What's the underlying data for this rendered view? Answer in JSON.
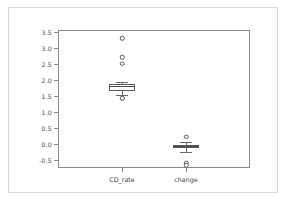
{
  "chart_data": {
    "type": "box",
    "title": "",
    "xlabel": "",
    "ylabel": "",
    "ylim": [
      -0.75,
      3.55
    ],
    "grid": false,
    "legend": null,
    "yticks": [
      3.5,
      3.0,
      2.5,
      2.0,
      1.5,
      1.0,
      0.5,
      0.0,
      -0.5
    ],
    "ytick_labels": [
      "3.5",
      "3.0",
      "2.5",
      "2.0",
      "1.5",
      "1.0",
      "0.5",
      "0.0",
      "-0.5"
    ],
    "categories": [
      "CD_rate",
      "change"
    ],
    "boxes": [
      {
        "label": "CD_rate",
        "q1": 1.66,
        "median": 1.79,
        "q3": 1.86,
        "whisker_low": 1.52,
        "whisker_high": 1.92,
        "fliers": [
          3.3,
          2.7,
          2.5,
          1.43
        ]
      },
      {
        "label": "change",
        "q1": -0.13,
        "median": -0.07,
        "q3": -0.02,
        "whisker_low": -0.25,
        "whisker_high": 0.05,
        "fliers": [
          0.22,
          -0.58,
          -0.66
        ]
      }
    ],
    "colors": {
      "box_edge": "#5a5a5a",
      "median": "#4a4a4a",
      "whisker": "#6a6a6a",
      "flier_edge": "#555555",
      "axis": "#8a8a8a",
      "tick_text": "#4a4a4a",
      "background": "#ffffff",
      "outer_border": "#d8d8d8"
    }
  }
}
